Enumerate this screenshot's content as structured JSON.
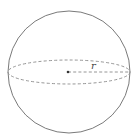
{
  "diagram": {
    "radius_label": "r",
    "colors": {
      "stroke": "#7a7a7a",
      "dashed": "#8a8a8a",
      "center": "#333333",
      "background": "#ffffff"
    },
    "elements": [
      {
        "type": "circle",
        "name": "sphere-outline",
        "cx": 69,
        "cy": 72,
        "r": 61
      },
      {
        "type": "ellipse",
        "name": "equator",
        "cx": 69,
        "cy": 72,
        "rx": 61,
        "ry": 12,
        "style": "dashed"
      },
      {
        "type": "point",
        "name": "center",
        "x": 68,
        "y": 72
      },
      {
        "type": "line",
        "name": "radius",
        "x1": 68,
        "y1": 72,
        "x2": 129,
        "y2": 72,
        "style": "dashed"
      }
    ]
  }
}
